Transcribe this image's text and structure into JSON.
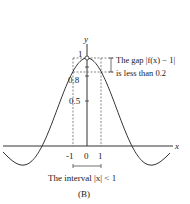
{
  "chart_data": {
    "type": "line",
    "title": "",
    "function": "f(x) = sin(x)/x",
    "xlabel": "x",
    "ylabel": "y",
    "y_ticks": [
      "0.5",
      "0.8",
      "1"
    ],
    "x_ticks": [
      "-1",
      "0",
      "1"
    ],
    "annotations": {
      "gap_line1": "The gap |f(x) − 1|",
      "gap_line2": "is less than 0.2",
      "interval": "The interval |x| < 1"
    },
    "caption": "(B)",
    "xlim": [
      -6,
      7
    ],
    "ylim": [
      -0.3,
      1.2
    ]
  }
}
